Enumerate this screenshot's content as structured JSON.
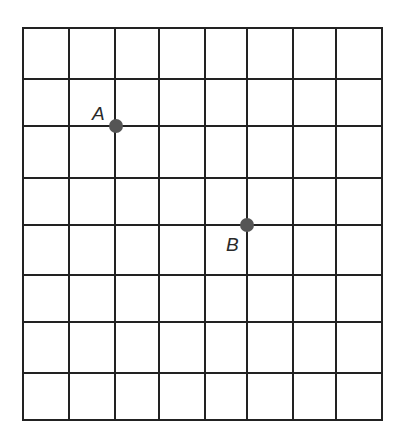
{
  "diagram": {
    "type": "grid",
    "columns": 8,
    "rows": 8,
    "line_color": "#222222",
    "point_color": "#555555",
    "x_lines": [
      23,
      69,
      115,
      159,
      205,
      247,
      293,
      336,
      382
    ],
    "y_lines": [
      28,
      79,
      126,
      178,
      225,
      275,
      322,
      373,
      420
    ],
    "points": [
      {
        "label": "A",
        "grid_x": 2,
        "grid_y": 2,
        "px": 116,
        "py": 126,
        "label_x": 92,
        "label_y": 120
      },
      {
        "label": "B",
        "grid_x": 5,
        "grid_y": 4,
        "px": 247,
        "py": 225,
        "label_x": 226,
        "label_y": 251
      }
    ]
  }
}
